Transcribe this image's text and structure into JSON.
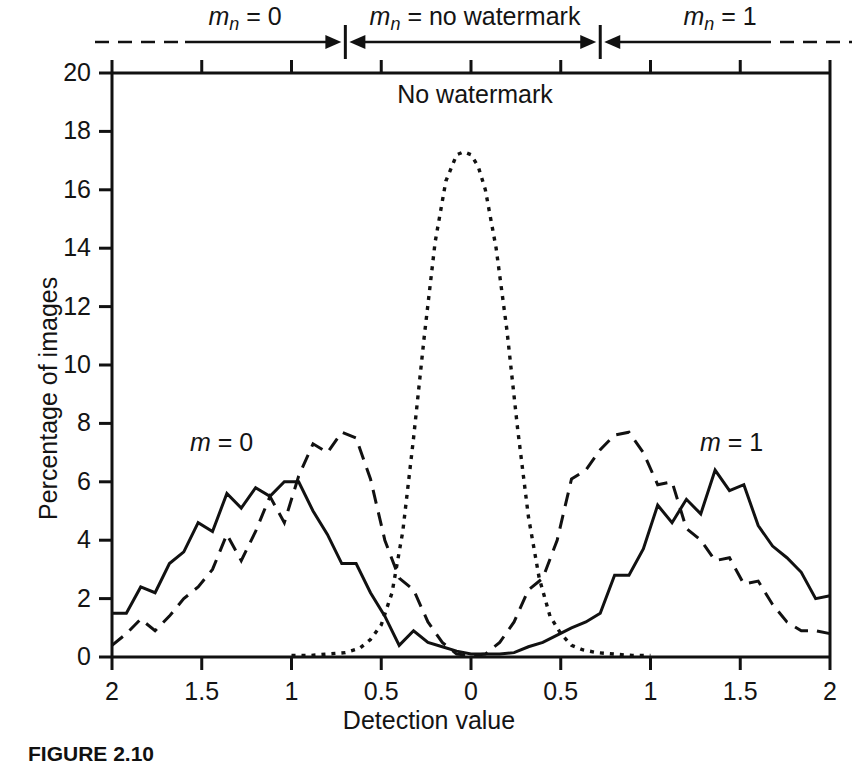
{
  "figure": {
    "caption": "FIGURE 2.10",
    "inner_annotation": "No watermark",
    "segment_labels": [
      {
        "id": "mn-0",
        "text": "m",
        "sub": "n",
        "rest": " = 0"
      },
      {
        "id": "mn-nowm",
        "text": "m",
        "sub": "n",
        "rest": " = no watermark"
      },
      {
        "id": "mn-1",
        "text": "m",
        "sub": "n",
        "rest": " = 1"
      }
    ],
    "series_labels": [
      {
        "id": "m-0",
        "text": "m",
        "rest": " = 0"
      },
      {
        "id": "m-1",
        "text": "m",
        "rest": " = 1"
      }
    ]
  },
  "chart_data": {
    "type": "line",
    "title": "",
    "subtitle": "",
    "xlabel": "Detection value",
    "ylabel": "Percentage of images",
    "grid": false,
    "legend_position": "inline-annotations",
    "xlim": [
      -2,
      2
    ],
    "ylim": [
      0,
      20
    ],
    "x_tick_values": [
      -2,
      -1.5,
      -1,
      -0.5,
      0,
      0.5,
      1,
      1.5,
      2
    ],
    "x_tick_labels": [
      "2",
      "1.5",
      "1",
      "0.5",
      "0",
      "0.5",
      "1",
      "1.5",
      "2"
    ],
    "y_tick_values": [
      0,
      2,
      4,
      6,
      8,
      10,
      12,
      14,
      16,
      18,
      20
    ],
    "y_tick_labels": [
      "0",
      "2",
      "4",
      "6",
      "8",
      "10",
      "12",
      "14",
      "16",
      "18",
      "20"
    ],
    "annotations": [
      {
        "text": "No watermark",
        "x": 0.0,
        "y": 19.0
      },
      {
        "text": "m = 0",
        "x": -1.33,
        "y": 7.3
      },
      {
        "text": "m = 1",
        "x": 1.27,
        "y": 7.3
      }
    ],
    "segment_ranges": [
      {
        "label": "m_n = 0",
        "from": -2.0,
        "to": -0.7
      },
      {
        "label": "m_n = no watermark",
        "from": -0.7,
        "to": 0.72
      },
      {
        "label": "m_n = 1",
        "from": 0.72,
        "to": 2.0
      }
    ],
    "series": [
      {
        "name": "m = 0 (solid)",
        "style": "solid",
        "color": "#111111",
        "x": [
          -2.0,
          -1.92,
          -1.84,
          -1.76,
          -1.68,
          -1.6,
          -1.52,
          -1.44,
          -1.36,
          -1.28,
          -1.2,
          -1.12,
          -1.04,
          -0.96,
          -0.88,
          -0.8,
          -0.72,
          -0.64,
          -0.56,
          -0.48,
          -0.4,
          -0.32,
          -0.24,
          -0.16,
          -0.08,
          0.0,
          0.08,
          0.16,
          0.24,
          0.32,
          0.4,
          0.48,
          0.56,
          0.64,
          0.72,
          0.8,
          0.88,
          0.96,
          1.04,
          1.12,
          1.2,
          1.28,
          1.36,
          1.44,
          1.52,
          1.6,
          1.68,
          1.76,
          1.84,
          1.92,
          2.0
        ],
        "y": [
          1.5,
          1.5,
          2.4,
          2.2,
          3.2,
          3.6,
          4.6,
          4.3,
          5.6,
          5.1,
          5.8,
          5.5,
          6.0,
          6.0,
          5.0,
          4.2,
          3.2,
          3.2,
          2.2,
          1.4,
          0.4,
          0.9,
          0.5,
          0.35,
          0.2,
          0.1,
          0.1,
          0.1,
          0.15,
          0.35,
          0.5,
          0.75,
          1.0,
          1.2,
          1.5,
          2.8,
          2.8,
          3.7,
          5.2,
          4.6,
          5.4,
          4.9,
          6.4,
          5.7,
          5.9,
          4.5,
          3.8,
          3.4,
          2.9,
          2.0,
          2.1
        ]
      },
      {
        "name": "watermarked (dashed)",
        "style": "dashed",
        "color": "#111111",
        "x": [
          -2.0,
          -1.92,
          -1.84,
          -1.76,
          -1.68,
          -1.6,
          -1.52,
          -1.44,
          -1.36,
          -1.28,
          -1.2,
          -1.12,
          -1.04,
          -0.96,
          -0.88,
          -0.8,
          -0.72,
          -0.64,
          -0.56,
          -0.48,
          -0.4,
          -0.32,
          -0.24,
          -0.16,
          -0.08,
          0.0,
          0.08,
          0.16,
          0.24,
          0.32,
          0.4,
          0.48,
          0.56,
          0.64,
          0.72,
          0.8,
          0.88,
          0.96,
          1.04,
          1.12,
          1.2,
          1.28,
          1.36,
          1.44,
          1.52,
          1.6,
          1.68,
          1.76,
          1.84,
          1.92,
          2.0
        ],
        "y": [
          0.4,
          0.8,
          1.3,
          0.9,
          1.4,
          2.0,
          2.4,
          3.0,
          4.2,
          3.3,
          4.3,
          5.5,
          4.6,
          6.2,
          7.3,
          7.0,
          7.7,
          7.5,
          6.1,
          4.0,
          2.7,
          2.3,
          1.2,
          0.5,
          0.1,
          0.05,
          0.1,
          0.5,
          1.2,
          2.3,
          2.7,
          4.0,
          6.1,
          6.4,
          7.1,
          7.6,
          7.7,
          7.0,
          5.9,
          6.0,
          4.4,
          4.0,
          3.3,
          3.4,
          2.5,
          2.6,
          1.8,
          1.2,
          0.9,
          0.9,
          0.8
        ]
      },
      {
        "name": "no watermark (dotted)",
        "style": "dotted",
        "color": "#111111",
        "x": [
          -1.0,
          -0.9,
          -0.8,
          -0.7,
          -0.62,
          -0.56,
          -0.5,
          -0.44,
          -0.38,
          -0.32,
          -0.26,
          -0.2,
          -0.14,
          -0.08,
          -0.04,
          0.0,
          0.04,
          0.08,
          0.14,
          0.2,
          0.26,
          0.32,
          0.38,
          0.44,
          0.5,
          0.56,
          0.62,
          0.7,
          0.8,
          0.9,
          1.0
        ],
        "y": [
          0.05,
          0.05,
          0.1,
          0.15,
          0.3,
          0.6,
          1.1,
          2.2,
          4.3,
          7.5,
          11.0,
          14.2,
          16.3,
          17.2,
          17.3,
          17.2,
          16.8,
          16.0,
          14.0,
          11.2,
          7.8,
          4.8,
          2.7,
          1.4,
          0.8,
          0.4,
          0.25,
          0.15,
          0.1,
          0.05,
          0.05
        ]
      }
    ]
  }
}
